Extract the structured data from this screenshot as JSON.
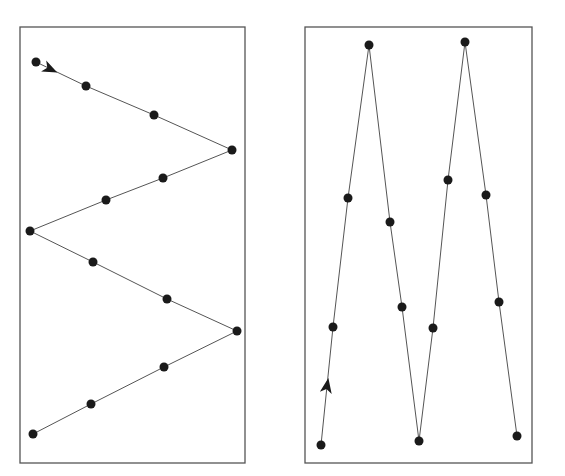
{
  "figure": {
    "background": "#ffffff",
    "line_color": "#555555",
    "point_color": "#1a1a1a",
    "border_color": "#555555"
  },
  "panels": [
    {
      "name": "zigzag-horizontal",
      "box": {
        "x": 20,
        "y": 27,
        "w": 225,
        "h": 436
      },
      "path": [
        [
          36,
          62
        ],
        [
          86,
          86
        ],
        [
          154,
          115
        ],
        [
          232,
          150
        ],
        [
          163,
          178
        ],
        [
          106,
          200
        ],
        [
          30,
          231
        ],
        [
          93,
          262
        ],
        [
          167,
          299
        ],
        [
          237,
          331
        ],
        [
          164,
          367
        ],
        [
          91,
          404
        ],
        [
          33,
          434
        ]
      ],
      "arrow": {
        "x": 50,
        "y": 69,
        "angle": 25
      }
    },
    {
      "name": "zigzag-vertical",
      "box": {
        "x": 305,
        "y": 27,
        "w": 227,
        "h": 436
      },
      "path": [
        [
          321,
          445
        ],
        [
          333,
          327
        ],
        [
          348,
          198
        ],
        [
          369,
          45
        ],
        [
          390,
          222
        ],
        [
          402,
          307
        ],
        [
          419,
          441
        ],
        [
          433,
          328
        ],
        [
          448,
          180
        ],
        [
          465,
          42
        ],
        [
          486,
          195
        ],
        [
          499,
          302
        ],
        [
          517,
          436
        ]
      ],
      "arrow": {
        "x": 327,
        "y": 386,
        "angle": -80
      }
    }
  ]
}
